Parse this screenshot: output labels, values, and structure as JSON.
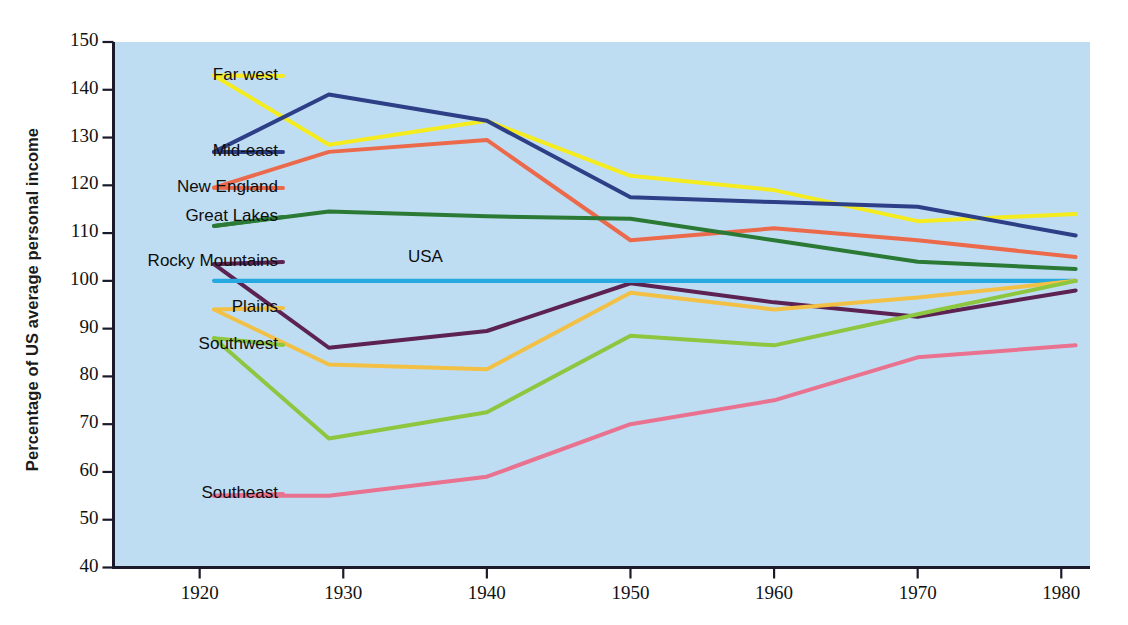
{
  "chart_data": {
    "type": "line",
    "title": "",
    "xlabel": "",
    "ylabel": "Percentage of US average personal income",
    "xlim": [
      1914,
      1982
    ],
    "ylim": [
      40,
      150
    ],
    "grid": false,
    "legend_position": "inline-left-labels",
    "background_color": "#bfddf2",
    "x_ticks": [
      1920,
      1930,
      1940,
      1950,
      1960,
      1970,
      1980
    ],
    "x_tick_labels": [
      "1920",
      "1930",
      "1940",
      "1950",
      "1960",
      "1970",
      "1980"
    ],
    "y_ticks": [
      40,
      50,
      60,
      70,
      80,
      90,
      100,
      110,
      120,
      130,
      140,
      150
    ],
    "y_tick_labels": [
      "40",
      "50",
      "60",
      "70",
      "80",
      "90",
      "100",
      "110",
      "120",
      "130",
      "140",
      "150"
    ],
    "x": [
      1921,
      1929,
      1940,
      1950,
      1960,
      1970,
      1981
    ],
    "series": [
      {
        "name": "Far west",
        "label": "Far west",
        "color": "#f5ec20",
        "values": [
          143.0,
          128.5,
          133.5,
          122.0,
          119.0,
          112.5,
          114.0
        ]
      },
      {
        "name": "Mid-east",
        "label": "Mid-east",
        "color": "#2c3f87",
        "values": [
          127.0,
          139.0,
          133.5,
          117.5,
          116.5,
          115.5,
          109.5
        ]
      },
      {
        "name": "New England",
        "label": "New England",
        "color": "#ec6a4c",
        "values": [
          119.5,
          127.0,
          129.5,
          108.5,
          111.0,
          108.5,
          105.0
        ]
      },
      {
        "name": "Great Lakes",
        "label": "Great Lakes",
        "color": "#2a7a35",
        "values": [
          111.5,
          114.5,
          113.5,
          113.0,
          108.5,
          104.0,
          102.5
        ]
      },
      {
        "name": "Rocky Mountains",
        "label": "Rocky Mountains",
        "color": "#5c2252",
        "values": [
          103.5,
          86.0,
          89.5,
          99.5,
          95.5,
          92.5,
          98.0
        ]
      },
      {
        "name": "USA",
        "label": "USA",
        "color": "#25a9e0",
        "values": [
          100.0,
          100.0,
          100.0,
          100.0,
          100.0,
          100.0,
          100.0
        ]
      },
      {
        "name": "Plains",
        "label": "Plains",
        "color": "#f2c044",
        "values": [
          94.0,
          82.5,
          81.5,
          97.5,
          94.0,
          96.5,
          100.0
        ]
      },
      {
        "name": "Southwest",
        "label": "Southwest",
        "color": "#8dc63f",
        "values": [
          88.0,
          67.0,
          72.5,
          88.5,
          86.5,
          93.0,
          100.0
        ]
      },
      {
        "name": "Southeast",
        "label": "Southeast",
        "color": "#e8728f",
        "values": [
          55.0,
          55.0,
          59.0,
          70.0,
          75.0,
          84.0,
          86.5
        ]
      }
    ],
    "annotations": [
      {
        "text": "USA",
        "x": 1936,
        "y": 104.5
      }
    ]
  },
  "series_labels": [
    {
      "text": "Far west",
      "anchor_x": 283,
      "anchor_y": 76
    },
    {
      "text": "Mid-east",
      "anchor_x": 283,
      "anchor_y": 152
    },
    {
      "text": "New England",
      "anchor_x": 283,
      "anchor_y": 188
    },
    {
      "text": "Great Lakes",
      "anchor_x": 283,
      "anchor_y": 217
    },
    {
      "text": "Rocky Mountains",
      "anchor_x": 283,
      "anchor_y": 262
    },
    {
      "text": "Plains",
      "anchor_x": 283,
      "anchor_y": 308
    },
    {
      "text": "Southwest",
      "anchor_x": 283,
      "anchor_y": 345
    },
    {
      "text": "Southeast",
      "anchor_x": 283,
      "anchor_y": 494
    }
  ],
  "usa_inline_label": {
    "text": "USA",
    "x": 408,
    "y": 247
  }
}
